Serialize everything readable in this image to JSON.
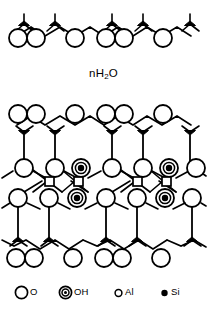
{
  "figure": {
    "title_text": "",
    "interlayer_label": "nH",
    "interlayer_label_sub": "2",
    "interlayer_label_tail": "O",
    "ink_color": "#000000",
    "background_color": "#ffffff"
  },
  "legend": {
    "items": [
      {
        "id": "o",
        "symbol": "oxygen-circle",
        "label": "O",
        "sub": ""
      },
      {
        "id": "oh",
        "symbol": "hydroxyl-double-circle",
        "label": "OH",
        "sub": ""
      },
      {
        "id": "al",
        "symbol": "aluminium-small-circle",
        "label": "Al",
        "sub": ""
      },
      {
        "id": "si",
        "symbol": "silicon-filled-dot",
        "label": "Si",
        "sub": ""
      }
    ]
  },
  "structure": {
    "name": "2:1 phyllosilicate layer with interlayer water",
    "sheets": [
      {
        "id": "upper-interlayer-tetrahedral",
        "type": "tetrahedral",
        "atoms": "O, Si"
      },
      {
        "id": "interlayer-water",
        "type": "interlayer",
        "atoms": "nH2O"
      },
      {
        "id": "tetrahedral-top",
        "type": "tetrahedral",
        "atoms": "O, Si"
      },
      {
        "id": "octahedral-middle",
        "type": "octahedral",
        "atoms": "O, OH, Al"
      },
      {
        "id": "tetrahedral-bottom",
        "type": "tetrahedral",
        "atoms": "O, Si"
      }
    ]
  }
}
